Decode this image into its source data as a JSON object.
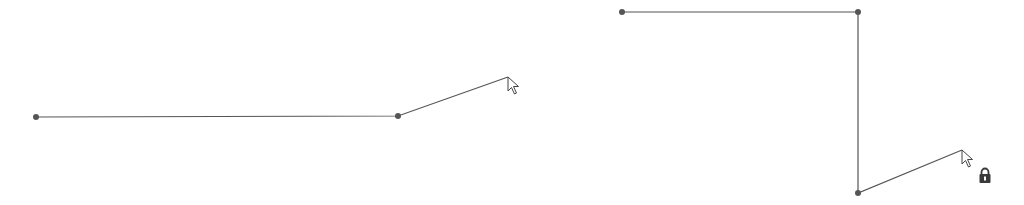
{
  "colors": {
    "line": "#555555",
    "point": "#555555",
    "cursor_fill": "#ffffff",
    "cursor_stroke": "#444444",
    "lock": "#3a3a3a",
    "background": "#ffffff"
  },
  "left_polyline": {
    "points": [
      [
        36,
        117
      ],
      [
        398,
        116
      ],
      [
        508,
        77
      ]
    ],
    "vertices": [
      [
        36,
        117
      ],
      [
        398,
        116
      ]
    ],
    "cursor_tip": [
      508,
      77
    ]
  },
  "right_polyline": {
    "points": [
      [
        622,
        12
      ],
      [
        858,
        12
      ],
      [
        858,
        193
      ],
      [
        962,
        150
      ]
    ],
    "vertices": [
      [
        622,
        12
      ],
      [
        858,
        12
      ],
      [
        858,
        193
      ]
    ],
    "cursor_tip": [
      962,
      150
    ]
  },
  "icons": {
    "cursor_left": "arrow-cursor-icon",
    "cursor_right": "arrow-cursor-icon",
    "lock": "lock-icon"
  }
}
